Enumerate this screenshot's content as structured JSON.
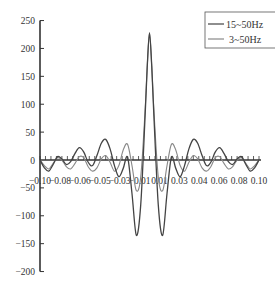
{
  "chart_data": {
    "type": "line",
    "title": "",
    "xlabel": "",
    "ylabel": "",
    "xlim": [
      -0.1,
      0.1
    ],
    "ylim": [
      -200,
      250
    ],
    "grid": false,
    "legend_position": "upper-right",
    "x_ticks": [
      "-0.10",
      "-0.08",
      "-0.06",
      "-0.05",
      "-0.03",
      "-0.01",
      "0.01",
      "0.03",
      "0.04",
      "0.06",
      "0.08",
      "0.10"
    ],
    "y_ticks": [
      "250",
      "200",
      "150",
      "100",
      "50",
      "0",
      "-50",
      "-100",
      "-150",
      "-200"
    ],
    "y_tick_values": [
      250,
      200,
      150,
      100,
      50,
      0,
      -50,
      -100,
      -150,
      -200
    ],
    "series": [
      {
        "name": "15~50Hz",
        "color": "#444444",
        "width": 1.3,
        "x": [
          -0.1,
          -0.096,
          -0.092,
          -0.088,
          -0.084,
          -0.08,
          -0.076,
          -0.072,
          -0.068,
          -0.064,
          -0.06,
          -0.056,
          -0.052,
          -0.048,
          -0.044,
          -0.04,
          -0.036,
          -0.032,
          -0.028,
          -0.024,
          -0.02,
          -0.016,
          -0.012,
          -0.008,
          -0.004,
          -0.002,
          0.0,
          0.002,
          0.004,
          0.008,
          0.012,
          0.016,
          0.02,
          0.024,
          0.028,
          0.032,
          0.036,
          0.04,
          0.044,
          0.048,
          0.052,
          0.056,
          0.06,
          0.064,
          0.068,
          0.072,
          0.076,
          0.08,
          0.084,
          0.088,
          0.092,
          0.096,
          0.1
        ],
        "values": [
          0,
          -14,
          -20,
          -8,
          6,
          2,
          -8,
          -3,
          12,
          22,
          14,
          -4,
          -10,
          8,
          30,
          37,
          20,
          -10,
          -30,
          -15,
          5,
          -60,
          -135,
          -80,
          80,
          170,
          228,
          170,
          80,
          -80,
          -135,
          -60,
          5,
          -15,
          -30,
          -10,
          20,
          37,
          30,
          8,
          -10,
          -4,
          14,
          22,
          12,
          -3,
          -8,
          2,
          6,
          -8,
          -20,
          -14,
          0
        ]
      },
      {
        "name": "3~50Hz",
        "color": "#888888",
        "width": 1.1,
        "x": [
          -0.1,
          -0.096,
          -0.092,
          -0.088,
          -0.084,
          -0.08,
          -0.076,
          -0.072,
          -0.068,
          -0.064,
          -0.06,
          -0.056,
          -0.052,
          -0.048,
          -0.044,
          -0.04,
          -0.036,
          -0.032,
          -0.028,
          -0.024,
          -0.02,
          -0.016,
          -0.012,
          -0.008,
          -0.004,
          -0.002,
          0.0,
          0.002,
          0.004,
          0.008,
          0.012,
          0.016,
          0.02,
          0.024,
          0.028,
          0.032,
          0.036,
          0.04,
          0.044,
          0.048,
          0.052,
          0.056,
          0.06,
          0.064,
          0.068,
          0.072,
          0.076,
          0.08,
          0.084,
          0.088,
          0.092,
          0.096,
          0.1
        ],
        "values": [
          0,
          -10,
          -16,
          -6,
          4,
          0,
          -12,
          -16,
          -6,
          6,
          4,
          -12,
          -20,
          -14,
          2,
          8,
          -4,
          -20,
          -10,
          18,
          28,
          -10,
          -55,
          -30,
          90,
          170,
          228,
          170,
          90,
          -30,
          -55,
          -10,
          28,
          18,
          -10,
          -20,
          -4,
          8,
          2,
          -14,
          -20,
          -12,
          4,
          6,
          -6,
          -16,
          -12,
          0,
          4,
          -6,
          -16,
          -10,
          0
        ]
      }
    ]
  },
  "legend": {
    "items": [
      {
        "label": "15~50Hz",
        "color": "#444444"
      },
      {
        "label": "3~50Hz",
        "color": "#888888"
      }
    ]
  },
  "axes": {
    "color": "#333333"
  }
}
